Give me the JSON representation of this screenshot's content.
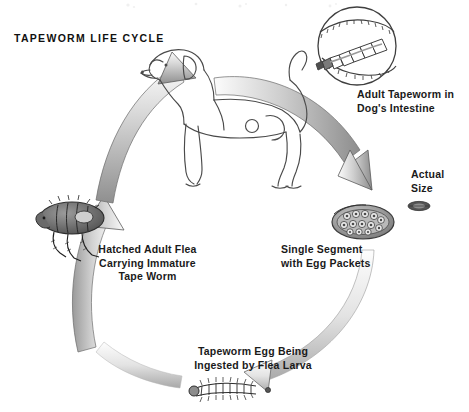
{
  "figure": {
    "title": "TAPEWORM LIFE CYCLE",
    "medium": "pencil-and-ink scanned illustration",
    "background_color": "#ffffff",
    "ink_color": "#1a1a1a",
    "arrow_fill_light": "#f2f2f2",
    "arrow_fill_mid": "#b9b9b9",
    "arrow_fill_dark": "#8a8a8a",
    "arrow_count": 4,
    "flow_direction": "clockwise"
  },
  "labels": {
    "intestine": {
      "line1": "Adult Tapeworm in",
      "line2": "Dog's Intestine"
    },
    "actual_size": {
      "line1": "Actual",
      "line2": "Size"
    },
    "segment": {
      "line1": "Single Segment",
      "line2": "with Egg Packets"
    },
    "flea": {
      "line1": "Hatched Adult Flea",
      "line2": "Carrying Immature",
      "line3": "Tape Worm"
    },
    "larva": {
      "line1": "Tapeworm Egg Being",
      "line2": "Ingested by Flea Larva"
    }
  },
  "illustrations": [
    {
      "name": "dog",
      "description": "line drawing of a short-haired dog facing left, tail raised",
      "position": "top-center"
    },
    {
      "name": "intestine-inset",
      "description": "circular magnified view of adult tapeworm inside intestine wall",
      "position": "top-right"
    },
    {
      "name": "actual-size-segment",
      "description": "tiny dark tapeworm segment shown at true scale",
      "position": "right"
    },
    {
      "name": "egg-segment",
      "description": "oval proglottid segment packed with round egg packets",
      "position": "right-lower"
    },
    {
      "name": "flea",
      "description": "dark hairy adult flea in profile with legs and bristles",
      "position": "left"
    },
    {
      "name": "flea-larva",
      "description": "bristly segmented flea larva beside a small tapeworm egg",
      "position": "bottom-center"
    }
  ],
  "cycle_stages": [
    {
      "order": 1,
      "stage": "Adult Tapeworm in Dog's Intestine"
    },
    {
      "order": 2,
      "stage": "Single Segment with Egg Packets"
    },
    {
      "order": 3,
      "stage": "Tapeworm Egg Being Ingested by Flea Larva"
    },
    {
      "order": 4,
      "stage": "Hatched Adult Flea Carrying Immature Tape Worm"
    }
  ]
}
